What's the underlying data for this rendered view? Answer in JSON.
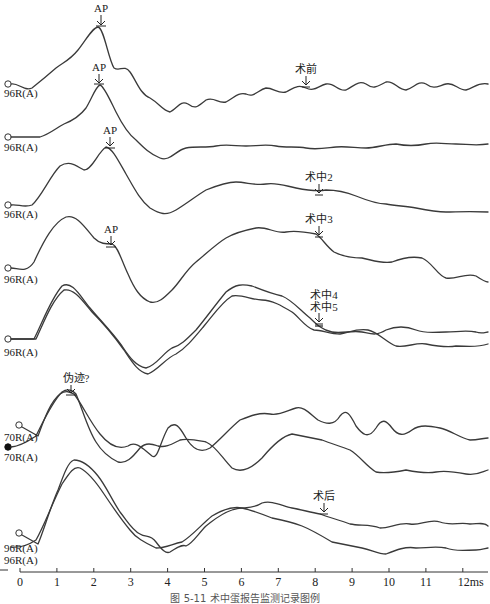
{
  "chart_data": {
    "type": "line",
    "title": "",
    "xlabel": "ms",
    "ylabel": "",
    "xlim": [
      0,
      12.5
    ],
    "x_ticks": [
      "0",
      "1",
      "2",
      "3",
      "4",
      "5",
      "6",
      "7",
      "8",
      "9",
      "10",
      "11",
      "12ms"
    ],
    "grid": false,
    "legend": "none (channel labels at left of each trace)",
    "series": [
      {
        "name": "术前",
        "channel": "96R(A)",
        "marker": "AP",
        "marker_ms": 2.1,
        "annotation": "术前",
        "annotation_ms": 7.8
      },
      {
        "name": "术中1",
        "channel": "96R(A)",
        "marker": "AP",
        "marker_ms": 2.1
      },
      {
        "name": "术中2",
        "channel": "96R(A)",
        "marker": "AP",
        "marker_ms": 2.4,
        "annotation": "术中2",
        "annotation_ms": 8.1
      },
      {
        "name": "术中3",
        "channel": "96R(A)",
        "marker": "AP",
        "marker_ms": 2.5,
        "annotation": "术中3",
        "annotation_ms": 8.1
      },
      {
        "name": "术中4",
        "channel": "96R(A)",
        "annotation": "术中4",
        "annotation_ms": 8.1
      },
      {
        "name": "术中5",
        "channel": "96R(A)",
        "annotation": "术中5",
        "annotation_ms": 8.1
      },
      {
        "name": "70R(A) a",
        "channel": "70R(A)",
        "marker": "伪迹?",
        "marker_ms": 1.4
      },
      {
        "name": "70R(A) b",
        "channel": "70R(A)"
      },
      {
        "name": "术后 a",
        "channel": "96R(A)",
        "annotation": "术后",
        "annotation_ms": 8.3
      },
      {
        "name": "术后 b",
        "channel": "96R(A)"
      }
    ]
  },
  "labels": {
    "ch1": "96R(A)",
    "ch2": "96R(A)",
    "ch3": "96R(A)",
    "ch4": "96R(A)",
    "ch5": "96R(A)",
    "ch6a": "70R(A)",
    "ch6b": "70R(A)",
    "ch7a": "96R(A)",
    "ch7b": "96R(A)"
  },
  "markers": {
    "ap1": "AP",
    "ap2": "AP",
    "ap3": "AP",
    "ap4": "AP",
    "artifact": "伪迹?",
    "pre": "术前",
    "intra2": "术中2",
    "intra3": "术中3",
    "intra4": "术中4",
    "intra5": "术中5",
    "post": "术后"
  },
  "axis": {
    "ticks": [
      "0",
      "1",
      "2",
      "3",
      "4",
      "5",
      "6",
      "7",
      "8",
      "9",
      "10",
      "11",
      "12ms"
    ]
  },
  "caption": "图 5-11  术中蛋报告监测记录图例"
}
